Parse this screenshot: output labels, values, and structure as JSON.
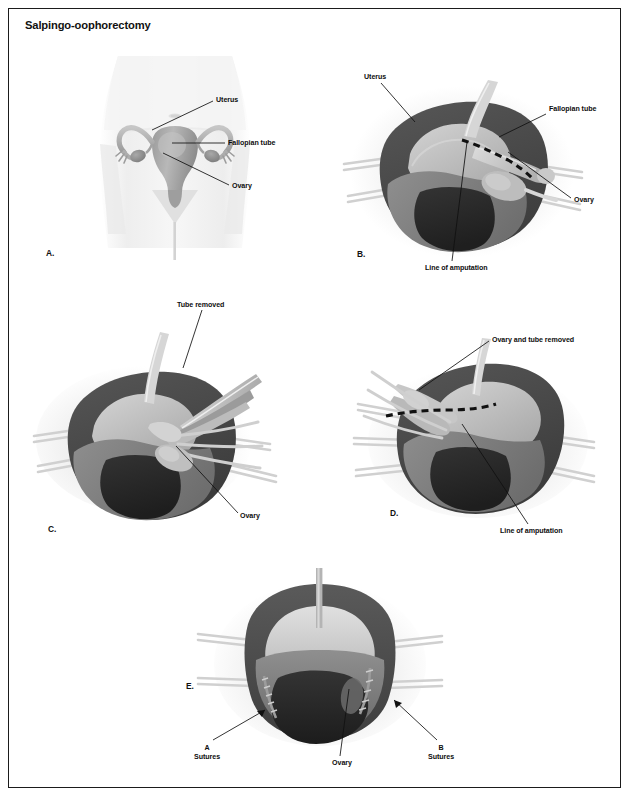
{
  "document": {
    "title": "Salpingo-oophorectomy",
    "border_color": "#1b1b1b",
    "background": "#ffffff"
  },
  "palette": {
    "ink": "#0d0d0d",
    "tissue_dark": "#4a4a4a",
    "tissue_mid": "#7e7e7e",
    "tissue_light": "#b9b9b9",
    "tissue_pale": "#d8d8d8",
    "cavity_black": "#2a2a2a",
    "body_tint": "#f2f2f2",
    "retractor": "#cfcfcf"
  },
  "panels": [
    {
      "id": "a",
      "letter": "A.",
      "caption": "Anatomy of uterus, fallopian tubes and ovaries in situ",
      "labels": [
        {
          "id": "uterus",
          "text": "Uterus"
        },
        {
          "id": "fallopian-tube",
          "text": "Fallopian tube"
        },
        {
          "id": "ovary",
          "text": "Ovary"
        }
      ]
    },
    {
      "id": "b",
      "letter": "B.",
      "caption": "Surgical field with line of amputation marked",
      "labels": [
        {
          "id": "uterus",
          "text": "Uterus"
        },
        {
          "id": "fallopian-tube",
          "text": "Fallopian tube"
        },
        {
          "id": "ovary",
          "text": "Ovary"
        },
        {
          "id": "line-of-amputation",
          "text": "Line of amputation"
        }
      ]
    },
    {
      "id": "c",
      "letter": "C.",
      "caption": "Fallopian tube excised with clamps in place",
      "labels": [
        {
          "id": "tube-removed",
          "text": "Tube removed"
        },
        {
          "id": "ovary",
          "text": "Ovary"
        }
      ]
    },
    {
      "id": "d",
      "letter": "D.",
      "caption": "Ovary and tube excised, second line of amputation marked",
      "labels": [
        {
          "id": "ovary-and-tube-removed",
          "text": "Ovary and tube removed"
        },
        {
          "id": "line-of-amputation",
          "text": "Line of amputation"
        }
      ]
    },
    {
      "id": "e",
      "letter": "E.",
      "caption": "Closed field showing suture lines",
      "labels": [
        {
          "id": "suture-a",
          "text": "A\nSutures",
          "line1": "A",
          "line2": "Sutures"
        },
        {
          "id": "ovary",
          "text": "Ovary"
        },
        {
          "id": "suture-b",
          "text": "B\nSutures",
          "line1": "B",
          "line2": "Sutures"
        }
      ]
    }
  ]
}
